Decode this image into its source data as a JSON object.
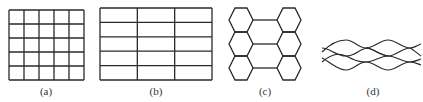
{
  "figure": {
    "panels": [
      {
        "id": "a",
        "label": "(a)",
        "kind": "square-grid",
        "cols": 5,
        "rows": 5,
        "x": 9,
        "y": 10,
        "width": 75,
        "height": 70,
        "label_x": 46
      },
      {
        "id": "b",
        "label": "(b)",
        "kind": "rectangular-grid",
        "cols": 3,
        "rows": 5,
        "x": 100,
        "y": 8,
        "width": 112,
        "height": 72,
        "label_x": 156
      },
      {
        "id": "c",
        "label": "(c)",
        "kind": "honeycomb",
        "label_x": 265
      },
      {
        "id": "d",
        "label": "(d)",
        "kind": "wavy-mesh",
        "label_x": 373
      }
    ],
    "stroke_color": "#2a2a2a"
  }
}
